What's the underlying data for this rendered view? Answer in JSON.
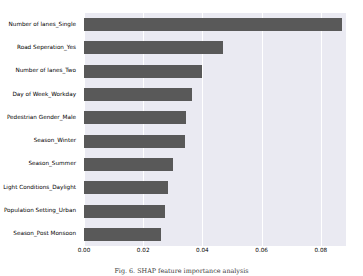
{
  "chart_data": {
    "type": "bar",
    "orientation": "horizontal",
    "title": "",
    "subtitle": "",
    "xlabel": "",
    "ylabel": "",
    "categories": [
      "Number of lanes_Single",
      "Road Seperation_Yes",
      "Number of lanes_Two",
      "Day of Week_Workday",
      "Pedestrian Gender_Male",
      "Season_Winter",
      "Season_Summer",
      "Light Conditions_Daylight",
      "Population Setting_Urban",
      "Season_Post Monsoon"
    ],
    "values": [
      0.0872,
      0.0468,
      0.04,
      0.0365,
      0.0345,
      0.034,
      0.03,
      0.0285,
      0.0275,
      0.026
    ],
    "xlim": [
      0.0,
      0.0885
    ],
    "ylim": [
      -0.5,
      9.5
    ],
    "xticks": [
      0.0,
      0.02,
      0.04,
      0.06,
      0.08
    ],
    "xticklabels": [
      "0.00",
      "0.02",
      "0.04",
      "0.06",
      "0.08"
    ],
    "grid": "vertical",
    "legend": "none",
    "bar_color": "#595959",
    "plot_background": "#eaeaf2",
    "grid_color": "#ffffff",
    "figure_background": "#ffffff"
  },
  "caption": {
    "text": "Fig. 6. SHAP feature importance analysis"
  }
}
